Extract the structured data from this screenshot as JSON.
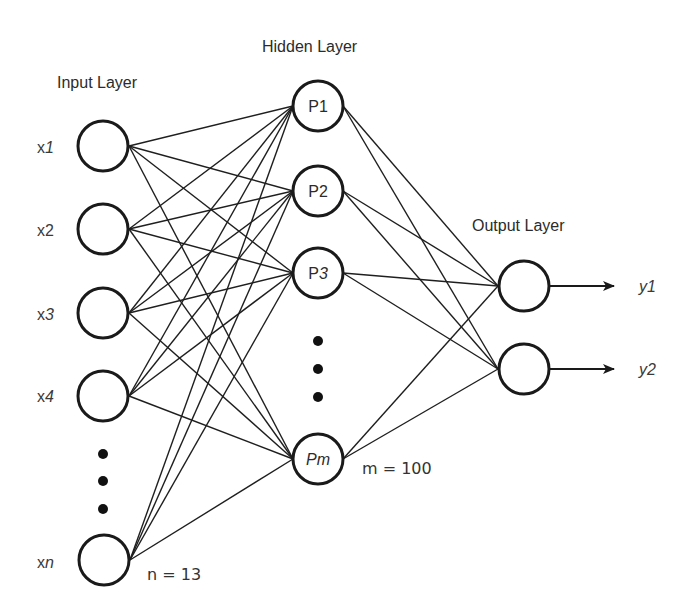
{
  "colors": {
    "background": "#ffffff",
    "stroke": "#1a1a1a",
    "text": "#2b2b2b"
  },
  "layers": {
    "input": {
      "title": "Input Layer",
      "size_label": "n = 13",
      "nodes": [
        {
          "label_base": "x",
          "label_sub": "1",
          "italic_sub": true
        },
        {
          "label_base": "x",
          "label_sub": "2",
          "italic_sub": false
        },
        {
          "label_base": "x",
          "label_sub": "3",
          "italic_sub": true
        },
        {
          "label_base": "x",
          "label_sub": "4",
          "italic_sub": true
        },
        {
          "label_base": "x",
          "label_sub": "n",
          "italic_sub": true
        }
      ],
      "ellipsis": "⋮"
    },
    "hidden": {
      "title": "Hidden Layer",
      "size_label": "m = 100",
      "nodes": [
        {
          "label_base": "P",
          "label_sub": "1",
          "italic": false
        },
        {
          "label_base": "P",
          "label_sub": "2",
          "italic": false
        },
        {
          "label_base": "P",
          "label_sub": "3",
          "italic": false
        },
        {
          "label_base": "Pm",
          "label_sub": "",
          "italic": true
        }
      ],
      "ellipsis": "⋮"
    },
    "output": {
      "title": "Output Layer",
      "nodes": [
        {
          "label_base": "y",
          "label_sub": "1",
          "italic": true
        },
        {
          "label_base": "y",
          "label_sub": "2",
          "italic": true
        }
      ]
    }
  },
  "connectivity": "fully-connected"
}
